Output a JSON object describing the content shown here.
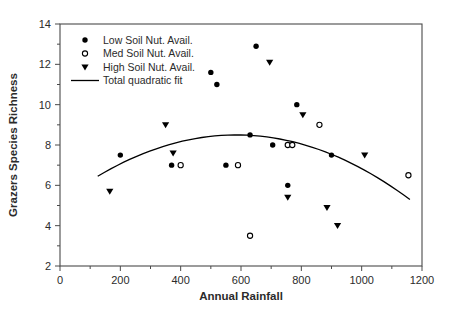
{
  "page": {
    "background": "#ffffff",
    "ink_color": "#000000",
    "axis_line_color": "#4a4a4a",
    "text_color": "#2b2b2b"
  },
  "chart_data": {
    "type": "scatter",
    "title": "",
    "xlabel": "Annual Rainfall",
    "ylabel": "Grazers Species Richness",
    "xlim": [
      0,
      1200
    ],
    "ylim": [
      2,
      14
    ],
    "x_ticks": [
      0,
      200,
      400,
      600,
      800,
      1000,
      1200
    ],
    "x_minor_ticks": [
      100,
      300,
      500,
      700,
      900,
      1100
    ],
    "y_ticks": [
      2,
      4,
      6,
      8,
      10,
      12,
      14
    ],
    "y_minor_ticks": [
      3,
      5,
      7,
      9,
      11,
      13
    ],
    "grid": false,
    "frame": "full-box",
    "legend_position": "top-left-inside",
    "series": [
      {
        "name": "Low Soil Nut. Avail.",
        "marker": "filled-circle",
        "color": "#000000",
        "points": [
          [
            200,
            7.5
          ],
          [
            370,
            7
          ],
          [
            500,
            11.6
          ],
          [
            520,
            11
          ],
          [
            550,
            7
          ],
          [
            630,
            8.5
          ],
          [
            650,
            12.9
          ],
          [
            705,
            8
          ],
          [
            755,
            6
          ],
          [
            785,
            10
          ],
          [
            900,
            7.5
          ]
        ]
      },
      {
        "name": "Med Soil Nut. Avail.",
        "marker": "open-circle",
        "color": "#000000",
        "points": [
          [
            400,
            7
          ],
          [
            590,
            7
          ],
          [
            630,
            3.5
          ],
          [
            755,
            8
          ],
          [
            770,
            8
          ],
          [
            860,
            9
          ],
          [
            1155,
            6.5
          ]
        ]
      },
      {
        "name": "High Soil Nut. Avail.",
        "marker": "filled-triangle-down",
        "color": "#000000",
        "points": [
          [
            165,
            5.7
          ],
          [
            350,
            9
          ],
          [
            375,
            7.6
          ],
          [
            695,
            12.1
          ],
          [
            755,
            5.4
          ],
          [
            805,
            9.5
          ],
          [
            885,
            4.9
          ],
          [
            920,
            4
          ],
          [
            1010,
            7.5
          ]
        ]
      }
    ],
    "fit_line": {
      "name": "Total quadratic fit",
      "type": "quadratic",
      "equation": "y = 8.5 - 0.0000097 * (x - 585)^2",
      "a": -9.7e-06,
      "vertex_x": 585,
      "vertex_y": 8.5,
      "x_domain": [
        125,
        1160
      ],
      "color": "#000000"
    }
  }
}
